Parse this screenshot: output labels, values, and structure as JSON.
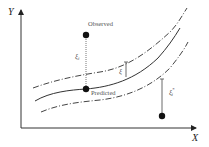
{
  "diagram": {
    "axes": {
      "x_label": "X",
      "y_label": "Y"
    },
    "points": {
      "observed_label": "Observed",
      "predicted_label": "Predicted"
    },
    "annotations": {
      "xi_i": "ξ",
      "xi_i_sub": "i",
      "epsilon": "ξ",
      "xi_i_star": "ξ",
      "xi_i_star_sub": "i",
      "xi_i_star_sup": "*"
    },
    "colors": {
      "line": "#333333",
      "point": "#111111",
      "background": "#ffffff"
    }
  }
}
